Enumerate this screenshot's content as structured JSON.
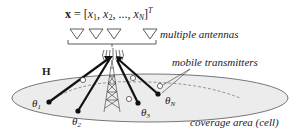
{
  "equation": {
    "lhs": "x",
    "eq": " = ",
    "open": "[",
    "x1": "x",
    "x1sub": "1",
    "sep1": ", ",
    "x2": "x",
    "x2sub": "2",
    "sep2": ", ..., ",
    "xn": "x",
    "xnsub": "N",
    "close": "]",
    "sup": "T"
  },
  "labels": {
    "antennas": "multiple antennas",
    "transmitters": "mobile transmitters",
    "coverage": "coverage area (cell)",
    "channel": "H"
  },
  "transmitters": [
    {
      "symbol": "θ",
      "sub": "1"
    },
    {
      "symbol": "θ",
      "sub": "2"
    },
    {
      "symbol": "θ",
      "sub": "3"
    },
    {
      "symbol": "θ",
      "sub": "N"
    }
  ],
  "colors": {
    "ellipse_fill": "#ececec",
    "stroke": "#222222",
    "text": "#222222"
  }
}
